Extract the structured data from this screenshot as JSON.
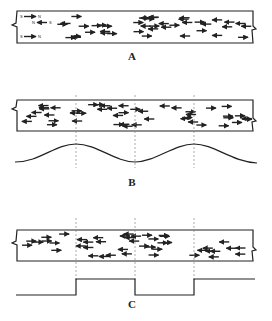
{
  "panels": [
    {
      "label": "A",
      "description": "Randomly oriented magnetic dipoles (unmagnetized bar)",
      "legend": [
        "S→N",
        "N←S",
        "S→N"
      ]
    },
    {
      "label": "B",
      "description": "Partially aligned domains with sinusoidal magnetization pattern"
    },
    {
      "label": "C",
      "description": "Aligned domains with square-wave magnetization pattern"
    }
  ],
  "colors": {
    "ink": "#222222",
    "dash": "#888888",
    "background": "#ffffff"
  }
}
